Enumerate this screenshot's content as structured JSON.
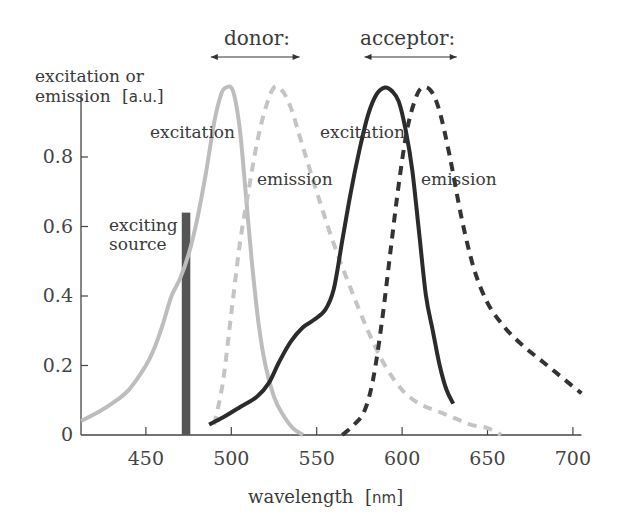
{
  "chart_data": {
    "type": "line",
    "title": "",
    "xlabel": "wavelength",
    "xlabel_unit": "nm",
    "ylabel": "excitation or emission",
    "ylabel_unit": "a.u.",
    "xlim": [
      412,
      705
    ],
    "ylim": [
      0,
      1.0
    ],
    "x_ticks": [
      450,
      500,
      550,
      600,
      650,
      700
    ],
    "y_ticks": [
      0,
      0.2,
      0.4,
      0.6,
      0.8
    ],
    "y_tick_labels": [
      "0",
      "0.2",
      "0.4",
      "0.6",
      "0.8"
    ],
    "x_tick_labels": [
      "450",
      "500",
      "550",
      "600",
      "650",
      "700"
    ],
    "grid": false,
    "group_labels": [
      {
        "text": "donor:",
        "x_range_nm": [
          488,
          540
        ]
      },
      {
        "text": "acceptor:",
        "x_range_nm": [
          578,
          632
        ]
      }
    ],
    "series": [
      {
        "name": "donor excitation",
        "group": "donor",
        "style": "solid",
        "color": "#bdbdbd",
        "label": "excitation",
        "x": [
          412,
          420,
          430,
          440,
          450,
          455,
          460,
          465,
          470,
          475,
          480,
          485,
          490,
          494,
          497,
          501,
          505,
          508,
          512,
          516,
          520,
          525,
          530,
          536,
          542
        ],
        "y": [
          0.04,
          0.06,
          0.09,
          0.13,
          0.2,
          0.25,
          0.32,
          0.4,
          0.45,
          0.52,
          0.62,
          0.75,
          0.9,
          0.98,
          1.0,
          0.99,
          0.88,
          0.72,
          0.5,
          0.32,
          0.2,
          0.11,
          0.06,
          0.02,
          0.0
        ]
      },
      {
        "name": "donor emission",
        "group": "donor",
        "style": "dashed",
        "color": "#c4c4c4",
        "label": "emission",
        "x": [
          490,
          495,
          500,
          505,
          510,
          515,
          520,
          525,
          530,
          535,
          540,
          550,
          560,
          570,
          580,
          590,
          600,
          610,
          620,
          630,
          640,
          650,
          658
        ],
        "y": [
          0.03,
          0.15,
          0.35,
          0.55,
          0.7,
          0.84,
          0.94,
          1.0,
          0.99,
          0.94,
          0.86,
          0.7,
          0.55,
          0.42,
          0.3,
          0.2,
          0.13,
          0.09,
          0.07,
          0.05,
          0.03,
          0.02,
          0.0
        ]
      },
      {
        "name": "acceptor excitation",
        "group": "acceptor",
        "style": "solid",
        "color": "#2b2b2b",
        "label": "excitation",
        "x": [
          487,
          495,
          505,
          515,
          522,
          528,
          535,
          542,
          548,
          555,
          560,
          565,
          570,
          575,
          580,
          585,
          590,
          594,
          598,
          602,
          606,
          610,
          614,
          618,
          622,
          626,
          630
        ],
        "y": [
          0.03,
          0.05,
          0.08,
          0.11,
          0.15,
          0.21,
          0.27,
          0.31,
          0.33,
          0.36,
          0.42,
          0.56,
          0.7,
          0.82,
          0.92,
          0.98,
          1.0,
          0.99,
          0.96,
          0.88,
          0.76,
          0.58,
          0.4,
          0.3,
          0.2,
          0.13,
          0.09
        ]
      },
      {
        "name": "acceptor emission",
        "group": "acceptor",
        "style": "dashed",
        "color": "#333333",
        "label": "emission",
        "x": [
          565,
          572,
          578,
          583,
          588,
          593,
          598,
          603,
          608,
          612,
          617,
          622,
          628,
          635,
          642,
          650,
          660,
          670,
          680,
          690,
          700,
          705
        ],
        "y": [
          0.0,
          0.03,
          0.07,
          0.16,
          0.32,
          0.52,
          0.72,
          0.88,
          0.97,
          1.0,
          0.99,
          0.93,
          0.8,
          0.62,
          0.48,
          0.38,
          0.31,
          0.26,
          0.22,
          0.18,
          0.14,
          0.12
        ]
      }
    ],
    "bars": [
      {
        "name": "exciting source",
        "x_start": 471,
        "x_end": 476,
        "height": 0.64,
        "color": "#555555"
      }
    ],
    "annotations": [
      {
        "text": "excitation",
        "series": "donor excitation"
      },
      {
        "text": "emission",
        "series": "donor emission"
      },
      {
        "text": "excitation",
        "series": "acceptor excitation"
      },
      {
        "text": "emission",
        "series": "acceptor emission"
      },
      {
        "text": "exciting source",
        "series": "exciting source"
      }
    ]
  },
  "labels": {
    "donor": "donor:",
    "acceptor": "acceptor:",
    "ylabel_line1": "excitation or",
    "ylabel_line2": "emission",
    "ylabel_unit": "[a.u.]",
    "xlabel": "wavelength",
    "xlabel_unit": "[nm]",
    "donor_excitation": "excitation",
    "donor_emission": "emission",
    "acceptor_excitation": "excitation",
    "acceptor_emission": "emission",
    "exciting_line1": "exciting",
    "exciting_line2": "source"
  }
}
